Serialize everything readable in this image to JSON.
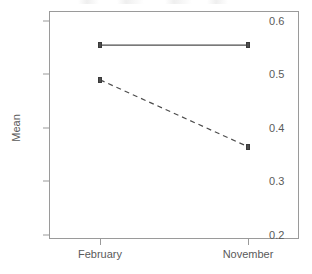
{
  "chart_data": {
    "type": "line",
    "title": "",
    "xlabel": "",
    "ylabel": "Mean",
    "categories": [
      "February",
      "November"
    ],
    "series": [
      {
        "name": "series-1",
        "style": "solid",
        "values": [
          0.555,
          0.555
        ],
        "marker": "square"
      },
      {
        "name": "series-2",
        "style": "dashed",
        "values": [
          0.49,
          0.365
        ],
        "marker": "square"
      }
    ],
    "ylim": [
      0.2,
      0.6
    ],
    "yticks": [
      0.2,
      0.3,
      0.4,
      0.5,
      0.6
    ],
    "ytick_labels": [
      "0.2",
      "0.3",
      "0.4",
      "0.5",
      "0.6"
    ],
    "xticks": [
      "February",
      "November"
    ],
    "grid": false,
    "legend": "none",
    "frame": "box"
  },
  "axes": {
    "y": {
      "title": "Mean",
      "ticks": [
        {
          "value": 0.6,
          "label": "0.6"
        },
        {
          "value": 0.5,
          "label": "0.5"
        },
        {
          "value": 0.4,
          "label": "0.4"
        },
        {
          "value": 0.3,
          "label": "0.3"
        },
        {
          "value": 0.2,
          "label": "0.2"
        }
      ]
    },
    "x": {
      "title": "",
      "ticks": [
        {
          "label": "February"
        },
        {
          "label": "November"
        }
      ]
    }
  },
  "colors": {
    "axis": "#9a9a9a",
    "text": "#5a5a5a",
    "line": "#4d4d4d",
    "marker": "#4d4d4d",
    "background": "#ffffff"
  }
}
